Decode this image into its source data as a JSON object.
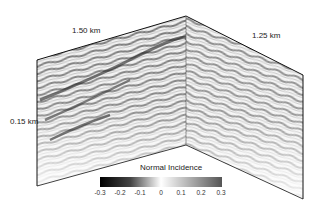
{
  "figure": {
    "labels": {
      "left_panel_length": "1.50 km",
      "right_panel_length": "1.25 km",
      "depth": "0.15 km"
    },
    "colorbar": {
      "title": "Normal Incidence",
      "ticks": [
        "-0.3",
        "-0.2",
        "-0.1",
        "0",
        "0.1",
        "0.2",
        "0.3"
      ],
      "min": -0.3,
      "max": 0.3,
      "colormap": [
        "#000000",
        "#ffffff",
        "#555555"
      ]
    }
  }
}
